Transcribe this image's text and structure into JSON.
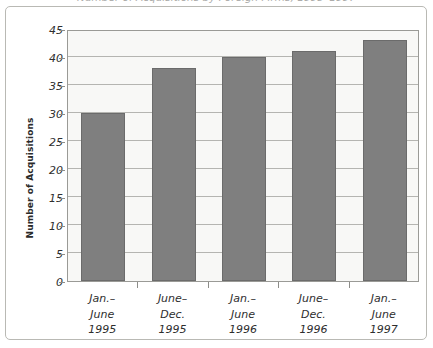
{
  "figure": {
    "title_cropped": "Number of Acquisitions by Foreign Firms, 1995–1997",
    "ylabel": "Number of Acquisitions"
  },
  "chart_data": {
    "type": "bar",
    "title": "",
    "xlabel": "",
    "ylabel": "Number of Acquisitions",
    "categories": [
      "Jan.–June 1995",
      "June–Dec. 1995",
      "Jan.–June 1996",
      "June–Dec. 1996",
      "Jan.–June 1997"
    ],
    "category_lines": [
      [
        "Jan.–",
        "June",
        "1995"
      ],
      [
        "June–",
        "Dec.",
        "1995"
      ],
      [
        "Jan.–",
        "June",
        "1996"
      ],
      [
        "June–",
        "Dec.",
        "1996"
      ],
      [
        "Jan.–",
        "June",
        "1997"
      ]
    ],
    "values": [
      30,
      38,
      40,
      41,
      43
    ],
    "ylim": [
      0,
      45
    ],
    "ytick_step": 5,
    "yticks": [
      0,
      5,
      10,
      15,
      20,
      25,
      30,
      35,
      40,
      45
    ],
    "grid": true,
    "legend": false,
    "bar_color": "#7f7f7f",
    "bar_edge_color": "#6b6b6b",
    "plot_background": "#f8f8f6",
    "gridline_color": "#b5b5b1",
    "axis_color": "#9a9a96",
    "frame_color": "#b9b9b4"
  }
}
